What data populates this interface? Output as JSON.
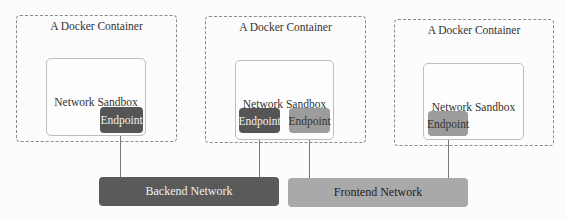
{
  "containers": [
    {
      "label": "A Docker Container",
      "sandbox_label": "Network Sandbox",
      "endpoints": [
        {
          "label": "Endpoint",
          "network": "Backend Network"
        }
      ]
    },
    {
      "label": "A Docker Container",
      "sandbox_label": "Network Sandbox",
      "endpoints": [
        {
          "label": "Endpoint",
          "network": "Backend Network"
        },
        {
          "label": "Endpoint",
          "network": "Frontend Network"
        }
      ]
    },
    {
      "label": "A Docker Container",
      "sandbox_label": "Network Sandbox",
      "endpoints": [
        {
          "label": "Endpoint",
          "network": "Frontend Network"
        }
      ]
    }
  ],
  "networks": [
    {
      "label": "Backend Network",
      "color": "#5a5a5a"
    },
    {
      "label": "Frontend Network",
      "color": "#a9a9a9"
    }
  ],
  "colors": {
    "endpoint_backend": "#555555",
    "endpoint_frontend": "#9c9c9c"
  }
}
